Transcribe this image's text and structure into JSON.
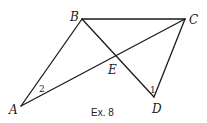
{
  "diagram": {
    "caption": "Ex. 8",
    "stroke_color": "#1a1a1a",
    "points": {
      "A": {
        "label": "A",
        "x": 21,
        "y": 106
      },
      "B": {
        "label": "B",
        "x": 82,
        "y": 19
      },
      "C": {
        "label": "C",
        "x": 185,
        "y": 19
      },
      "D": {
        "label": "D",
        "x": 154,
        "y": 97
      },
      "E": {
        "label": "E",
        "x": 116,
        "y": 56
      }
    },
    "segments": [
      {
        "from": "A",
        "to": "B"
      },
      {
        "from": "B",
        "to": "C"
      },
      {
        "from": "A",
        "to": "C"
      },
      {
        "from": "B",
        "to": "D"
      },
      {
        "from": "C",
        "to": "D"
      }
    ],
    "angle_labels": [
      {
        "label": "2",
        "at": "A"
      },
      {
        "label": "1",
        "at": "D"
      }
    ]
  }
}
